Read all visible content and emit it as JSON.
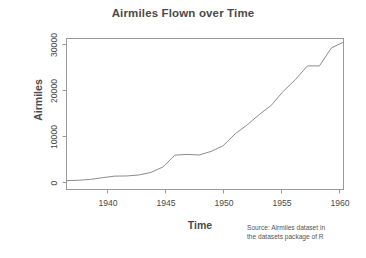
{
  "chart_data": {
    "type": "line",
    "title": "Airmiles Flown over Time",
    "xlabel": "Time",
    "ylabel": "Airmiles",
    "caption_line1": "Source: Airmiles dataset in",
    "caption_line2": "the datasets package of R",
    "x": [
      1937,
      1938,
      1939,
      1940,
      1941,
      1942,
      1943,
      1944,
      1945,
      1946,
      1947,
      1948,
      1949,
      1950,
      1951,
      1952,
      1953,
      1954,
      1955,
      1956,
      1957,
      1958,
      1959,
      1960
    ],
    "values": [
      412,
      480,
      683,
      1052,
      1385,
      1418,
      1634,
      2178,
      3362,
      5948,
      6109,
      5981,
      6753,
      8003,
      10566,
      12528,
      14760,
      16769,
      19819,
      22362,
      25340,
      25343,
      29269,
      30514
    ],
    "series": [
      {
        "name": "airmiles",
        "values": [
          412,
          480,
          683,
          1052,
          1385,
          1418,
          1634,
          2178,
          3362,
          5948,
          6109,
          5981,
          6753,
          8003,
          10566,
          12528,
          14760,
          16769,
          19819,
          22362,
          25340,
          25343,
          29269,
          30514
        ]
      }
    ],
    "xticks": [
      1940,
      1945,
      1950,
      1955,
      1960
    ],
    "xtick_labels": [
      "1940",
      "1945",
      "1950",
      "1955",
      "1960"
    ],
    "yticks": [
      0,
      10000,
      20000,
      30000
    ],
    "ytick_labels": [
      "0",
      "10000",
      "20000",
      "30000"
    ],
    "xlim": [
      1937,
      1960
    ],
    "ylim": [
      0,
      30514
    ],
    "grid": false,
    "legend": false,
    "line_color": "#8c8c8c",
    "box_color": "#9a9a9a",
    "background": "#ffffff"
  }
}
